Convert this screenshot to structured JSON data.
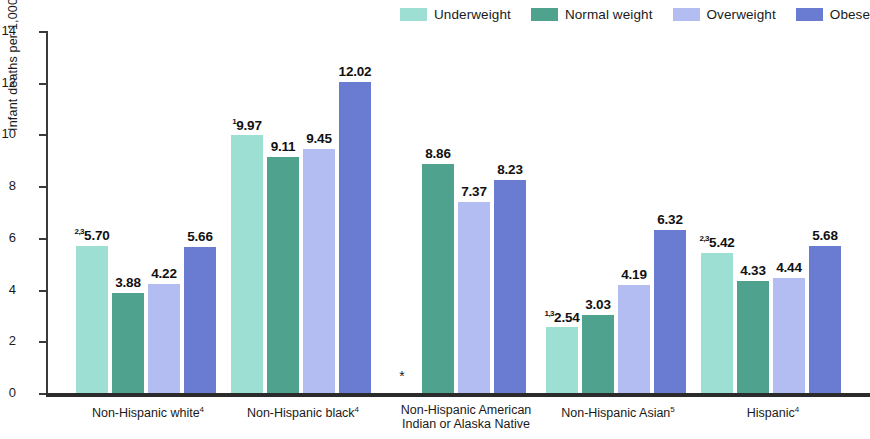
{
  "chart_data": {
    "type": "bar",
    "title": "",
    "xlabel": "",
    "ylabel": "Infant deaths per 1,000 live births",
    "ylim": [
      0,
      14
    ],
    "yticks": [
      0,
      2,
      4,
      6,
      8,
      10,
      12,
      14
    ],
    "ytick_labels": [
      "0",
      "2",
      "4",
      "6",
      "8",
      "10",
      "12",
      "14"
    ],
    "grid": false,
    "legend_position": "top-right",
    "categories": [
      "Non-Hispanic white",
      "Non-Hispanic black",
      "Non-Hispanic American Indian or Alaska Native",
      "Non-Hispanic Asian",
      "Hispanic"
    ],
    "category_label_lines": [
      [
        "Non-Hispanic white"
      ],
      [
        "Non-Hispanic black"
      ],
      [
        "Non-Hispanic American",
        "Indian or Alaska Native"
      ],
      [
        "Non-Hispanic Asian"
      ],
      [
        "Hispanic"
      ]
    ],
    "category_footnotes": [
      "4",
      "4",
      "",
      "5",
      "4"
    ],
    "series": [
      {
        "name": "Underweight",
        "color": "#9ddfd2",
        "values": [
          5.7,
          9.97,
          null,
          2.54,
          5.42
        ],
        "labels": [
          "5.70",
          "9.97",
          "",
          "2.54",
          "5.42"
        ],
        "footnotes": [
          "2,3",
          "1",
          "",
          "1,3",
          "2,3"
        ]
      },
      {
        "name": "Normal weight",
        "color": "#4fa38e",
        "values": [
          3.88,
          9.11,
          8.86,
          3.03,
          4.33
        ],
        "labels": [
          "3.88",
          "9.11",
          "8.86",
          "3.03",
          "4.33"
        ],
        "footnotes": [
          "",
          "",
          "",
          "",
          ""
        ]
      },
      {
        "name": "Overweight",
        "color": "#b3bdf2",
        "values": [
          4.22,
          9.45,
          7.37,
          4.19,
          4.44
        ],
        "labels": [
          "4.22",
          "9.45",
          "7.37",
          "4.19",
          "4.44"
        ],
        "footnotes": [
          "",
          "",
          "",
          "",
          ""
        ]
      },
      {
        "name": "Obese",
        "color": "#6a7bd2",
        "values": [
          5.66,
          12.02,
          8.23,
          6.32,
          5.68
        ],
        "labels": [
          "5.66",
          "12.02",
          "8.23",
          "6.32",
          "5.68"
        ],
        "footnotes": [
          "",
          "",
          "",
          "",
          ""
        ]
      }
    ],
    "suppressed_marker": "*",
    "suppressed_cells": [
      {
        "category_index": 2,
        "series_index": 0
      }
    ]
  },
  "legend": {
    "items": [
      {
        "label": "Underweight",
        "color": "#9ddfd2"
      },
      {
        "label": "Normal weight",
        "color": "#4fa38e"
      },
      {
        "label": "Overweight",
        "color": "#b3bdf2"
      },
      {
        "label": "Obese",
        "color": "#6a7bd2"
      }
    ]
  }
}
